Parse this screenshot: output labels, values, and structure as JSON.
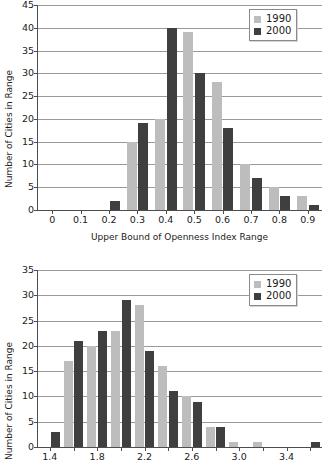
{
  "figure": {
    "background": "#ffffff",
    "series_colors": {
      "1990": "#bdbdbd",
      "2000": "#3f3f3f"
    }
  },
  "charts": [
    {
      "id": "openness-index-histogram",
      "ylabel": "Number of Cities in Range",
      "xlabel": "Upper Bound of Openness Index Range",
      "legend": {
        "position": "top-right",
        "entries": [
          "1990",
          "2000"
        ]
      },
      "legend_1990": "1990",
      "legend_2000": "2000",
      "yticks": [
        "0",
        "5",
        "10",
        "15",
        "20",
        "25",
        "30",
        "35",
        "40",
        "45"
      ],
      "xticks": [
        "0",
        "0.1",
        "0.2",
        "0.3",
        "0.4",
        "0.5",
        "0.6",
        "0.7",
        "0.8",
        "0.9"
      ]
    },
    {
      "id": "second-index-histogram",
      "ylabel": "Number of Cities in Range",
      "xlabel": "",
      "legend": {
        "position": "top-right",
        "entries": [
          "1990",
          "2000"
        ]
      },
      "legend_1990": "1990",
      "legend_2000": "2000",
      "yticks": [
        "0",
        "5",
        "10",
        "15",
        "20",
        "25",
        "30",
        "35"
      ],
      "xticks": [
        "1.4",
        "1.8",
        "2.2",
        "2.6",
        "3.0",
        "3.4"
      ]
    }
  ],
  "chart_data": [
    {
      "type": "bar",
      "title": "",
      "xlabel": "Upper Bound of Openness Index Range",
      "ylabel": "Number of Cities in Range",
      "categories": [
        "0",
        "0.1",
        "0.2",
        "0.3",
        "0.4",
        "0.5",
        "0.6",
        "0.7",
        "0.8",
        "0.9"
      ],
      "series": [
        {
          "name": "1990",
          "color": "#bdbdbd",
          "values": [
            0,
            0,
            0,
            15,
            20,
            39,
            28,
            10,
            5,
            3
          ]
        },
        {
          "name": "2000",
          "color": "#3f3f3f",
          "values": [
            0,
            0,
            2,
            19,
            40,
            30,
            18,
            7,
            3,
            1
          ]
        }
      ],
      "ylim": [
        0,
        45
      ],
      "ytick_step": 5,
      "xlim": [
        -0.05,
        0.95
      ],
      "grid": "horizontal",
      "legend_position": "top-right"
    },
    {
      "type": "bar",
      "title": "",
      "xlabel": "",
      "ylabel": "Number of Cities in Range",
      "categories": [
        "1.4",
        "1.6",
        "1.8",
        "2.0",
        "2.2",
        "2.4",
        "2.6",
        "2.8",
        "3.0",
        "3.2",
        "3.4",
        "3.6"
      ],
      "series": [
        {
          "name": "1990",
          "color": "#bdbdbd",
          "values": [
            0,
            17,
            20,
            23,
            28,
            16,
            10,
            4,
            1,
            1,
            0,
            0
          ]
        },
        {
          "name": "2000",
          "color": "#3f3f3f",
          "values": [
            3,
            21,
            23,
            29,
            19,
            11,
            9,
            4,
            0,
            0,
            0,
            1
          ]
        }
      ],
      "ylim": [
        0,
        35
      ],
      "ytick_step": 5,
      "xlim": [
        1.3,
        3.7
      ],
      "xtick_labels": [
        "1.4",
        "1.8",
        "2.2",
        "2.6",
        "3.0",
        "3.4"
      ],
      "grid": "horizontal",
      "legend_position": "top-right"
    }
  ]
}
